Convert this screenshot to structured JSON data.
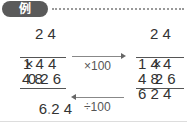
{
  "header": {
    "badge": "例"
  },
  "left_calc": {
    "multiplicand": "2 4",
    "multiplier_sign": "×",
    "multiplier": "0.2 6",
    "partial1": "1 4 4",
    "partial2": "4 8",
    "product_int": "6",
    "product_dec_mark": ".",
    "product_frac": "2 4"
  },
  "right_calc": {
    "multiplicand": "2 4",
    "multiplier_sign": "×",
    "multiplier": "2 6",
    "partial1": "1 4 4",
    "partial2": "4 8",
    "product": "6 2 4"
  },
  "arrows": {
    "top_label": "×100",
    "bottom_label": "÷100"
  }
}
